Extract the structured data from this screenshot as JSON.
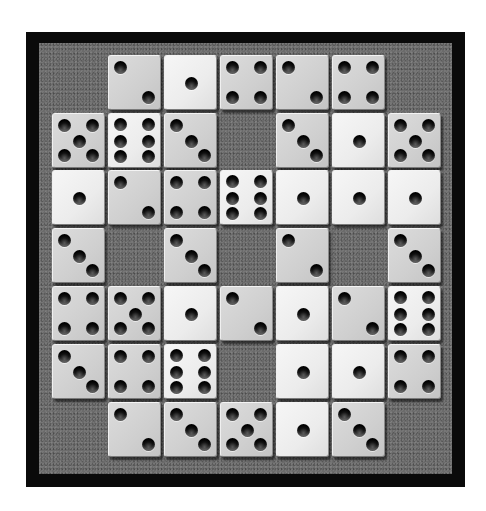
{
  "game": {
    "name": "dice-grid-puzzle",
    "grid_rows": 7,
    "grid_cols": 7,
    "colors": {
      "frame": "#0a0a0a",
      "field": "#6b6b6b",
      "die_gray": "#cfcfcf",
      "die_light": "#ececec",
      "pip": "#000000"
    },
    "board": [
      [
        null,
        2,
        1,
        4,
        2,
        4,
        null
      ],
      [
        5,
        6,
        3,
        null,
        3,
        1,
        5
      ],
      [
        1,
        2,
        4,
        6,
        1,
        1,
        1
      ],
      [
        3,
        null,
        3,
        null,
        2,
        null,
        3
      ],
      [
        4,
        5,
        1,
        2,
        1,
        2,
        6
      ],
      [
        3,
        4,
        6,
        null,
        1,
        1,
        4
      ],
      [
        null,
        2,
        3,
        5,
        1,
        3,
        null
      ]
    ],
    "light_faces": [
      1,
      6
    ]
  }
}
